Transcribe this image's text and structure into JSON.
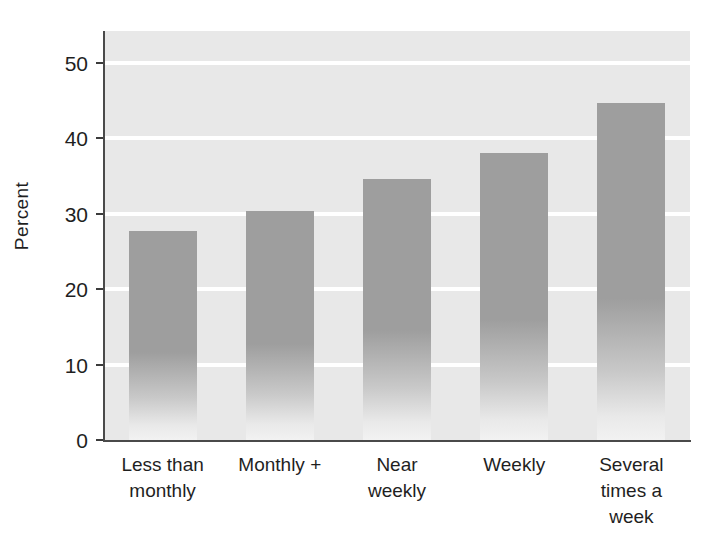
{
  "chart_data": {
    "type": "bar",
    "title": "",
    "xlabel": "",
    "ylabel": "Percent",
    "categories": [
      "Less than\nmonthly",
      "Monthly +",
      "Near\nweekly",
      "Weekly",
      "Several\ntimes a\nweek"
    ],
    "category_lines": [
      [
        "Less than",
        "monthly"
      ],
      [
        "Monthly +"
      ],
      [
        "Near",
        "weekly"
      ],
      [
        "Weekly"
      ],
      [
        "Several",
        "times a",
        "week"
      ]
    ],
    "values": [
      27.7,
      30.4,
      34.6,
      38.1,
      44.7
    ],
    "ylim": [
      0,
      54.2
    ],
    "xlim": [
      0,
      5
    ],
    "yticks": [
      0,
      10,
      20,
      30,
      40,
      50
    ],
    "ytick_labels": [
      "0",
      "10",
      "20",
      "30",
      "40",
      "50"
    ],
    "grid": true,
    "grid_axis": "y",
    "grid_color": "#ffffff",
    "legend": false,
    "legend_position": "none",
    "plot_background": "#e8e8e8",
    "bar_color": "#9e9e9e",
    "bar_gradient_bottom": "#f2f2f2",
    "axis_color": "#4a4a4a",
    "text_color": "#1f1f1f"
  }
}
